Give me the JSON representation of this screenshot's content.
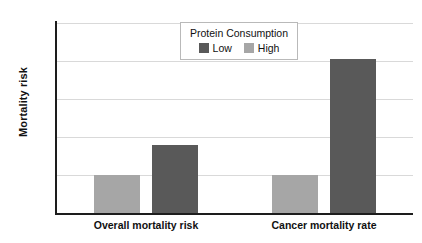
{
  "chart_data": {
    "type": "bar",
    "title": "",
    "xlabel": "",
    "ylabel": "Mortality risk",
    "ylim": [
      0,
      5
    ],
    "yticks": [
      "0",
      "1",
      "2",
      "3",
      "4",
      "5"
    ],
    "grid": true,
    "legend_position": "top-center",
    "legend_title": "Protein Consumption",
    "categories": [
      "Overall mortality risk",
      "Cancer mortality rate"
    ],
    "series": [
      {
        "name": "High",
        "color": "#a6a6a6",
        "values": [
          1.0,
          1.0
        ]
      },
      {
        "name": "Low",
        "color": "#595959",
        "values": [
          1.8,
          4.05
        ]
      }
    ]
  },
  "colors": {
    "low": "#595959",
    "high": "#a6a6a6",
    "axis": "#1d1d1d",
    "grid": "#d9d9d9",
    "background": "#ffffff"
  }
}
